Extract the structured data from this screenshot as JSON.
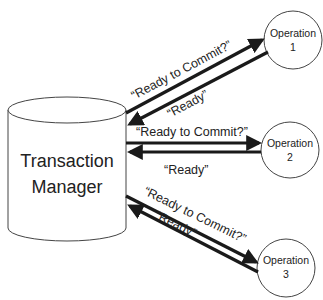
{
  "colors": {
    "background": "#ffffff",
    "stroke": "#1a1a1a",
    "text": "#222222"
  },
  "transaction_manager": {
    "line1": "Transaction",
    "line2": "Manager",
    "shape": "cylinder"
  },
  "operations": [
    {
      "line1": "Operation",
      "line2": "1"
    },
    {
      "line1": "Operation",
      "line2": "2"
    },
    {
      "line1": "Operation",
      "line2": "3"
    }
  ],
  "messages": [
    {
      "to_op": "“Ready  to  Commit?”",
      "from_op": "“Ready”"
    },
    {
      "to_op": "“Ready  to  Commit?”",
      "from_op": "“Ready”"
    },
    {
      "to_op": "“Ready  to  Commit?”",
      "from_op": "“Ready”"
    }
  ]
}
